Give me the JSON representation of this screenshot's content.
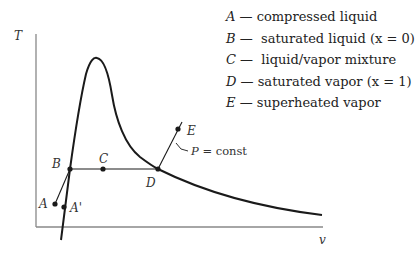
{
  "legend": {
    "items": [
      {
        "key": "A",
        "sep": " — ",
        "desc": "compressed liquid"
      },
      {
        "key": "B",
        "sep": " —  ",
        "desc": "saturated liquid (x = 0)"
      },
      {
        "key": "C",
        "sep": " —  ",
        "desc": "liquid/vapor mixture"
      },
      {
        "key": "D",
        "sep": " — ",
        "desc": "saturated vapor (x = 1)"
      },
      {
        "key": "E",
        "sep": " — ",
        "desc": "superheated vapor"
      }
    ]
  },
  "axes": {
    "y_label": "T",
    "x_label": "v"
  },
  "points": {
    "A": "A",
    "A_prime": "A'",
    "B": "B",
    "C": "C",
    "D": "D",
    "E": "E"
  },
  "annotations": {
    "isobar_p": "P",
    "isobar_rest": " = const"
  },
  "colors": {
    "curve": "#1a1a1a",
    "axis": "#777777",
    "text": "#222222"
  }
}
